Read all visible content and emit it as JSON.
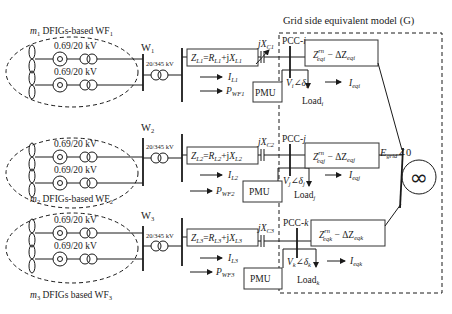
{
  "title": "Grid side equivalent model (G)",
  "grid_source": {
    "label_main": "E",
    "label_sub": "grid",
    "label_angle": "∠0",
    "symbol": "∞"
  },
  "wind_farms": [
    {
      "id": "WF1",
      "label_count": "m",
      "label_count_sub": "1",
      "label_text": " DFIGs-based WF",
      "label_text_sub": "1",
      "turbine_transformer_rating": "0.69/20 kV",
      "bus_label": "W",
      "bus_label_sub": "1",
      "step_up_rating": "20/345 kV",
      "line_impedance": {
        "Z": "Z",
        "Zsub": "L1",
        "eq": "=",
        "R": "R",
        "Rsub": "L1",
        "plus": "+j",
        "X": "X",
        "Xsub": "L1"
      },
      "capacitor": {
        "prefix": "jX",
        "sub": "C1",
        "variable": true
      },
      "current": {
        "main": "I",
        "sub": "L1"
      },
      "power": {
        "main": "P",
        "sub": "WF1"
      },
      "pmu_label": "PMU",
      "pcc_label": "PCC-",
      "pcc_index": "i",
      "voltage": {
        "V": "V",
        "Vsub": "i",
        "angle": "∠δ",
        "dsub": "i"
      },
      "load": {
        "main": "Load",
        "sub": "i"
      },
      "eq_impedance": {
        "Z": "Z",
        "sup": "rn",
        "sub": "eqi",
        "minus": " − ΔZ",
        "dsub": "eqi"
      },
      "eq_current": {
        "main": "I",
        "sub": "eqi"
      }
    },
    {
      "id": "WF2",
      "label_count": "m",
      "label_count_sub": "2",
      "label_text": " DFIGs-based WF",
      "label_text_sub": "2",
      "turbine_transformer_rating": "0.69/20 kV",
      "bus_label": "W",
      "bus_label_sub": "2",
      "step_up_rating": "20/345 kV",
      "line_impedance": {
        "Z": "Z",
        "Zsub": "L2",
        "eq": "=",
        "R": "R",
        "Rsub": "L2",
        "plus": "+j",
        "X": "X",
        "Xsub": "L2"
      },
      "capacitor": {
        "prefix": "jX",
        "sub": "C2",
        "variable": false
      },
      "current": {
        "main": "I",
        "sub": "L2"
      },
      "power": {
        "main": "P",
        "sub": "WF2"
      },
      "pmu_label": "PMU",
      "pcc_label": "PCC-",
      "pcc_index": "j",
      "voltage": {
        "V": "V",
        "Vsub": "j",
        "angle": "∠δ",
        "dsub": "j"
      },
      "load": {
        "main": "Load",
        "sub": "j"
      },
      "eq_impedance": {
        "Z": "Z",
        "sup": "rn",
        "sub": "eqj",
        "minus": " − ΔZ",
        "dsub": "eqj"
      },
      "eq_current": {
        "main": "I",
        "sub": "eqj"
      }
    },
    {
      "id": "WF3",
      "label_count": "m",
      "label_count_sub": "3",
      "label_text": " DFIGs based WF",
      "label_text_sub": "3",
      "turbine_transformer_rating": "0.69/20 kV",
      "bus_label": "W",
      "bus_label_sub": "3",
      "step_up_rating": "20/345 kV",
      "line_impedance": {
        "Z": "Z",
        "Zsub": "L3",
        "eq": "=",
        "R": "R",
        "Rsub": "L3",
        "plus": "+j",
        "X": "X",
        "Xsub": "L3"
      },
      "capacitor": {
        "prefix": "jX",
        "sub": "C3",
        "variable": false
      },
      "current": {
        "main": "I",
        "sub": "L3"
      },
      "power": {
        "main": "P",
        "sub": "WF3"
      },
      "pmu_label": "PMU",
      "pcc_label": "PCC-",
      "pcc_index": "k",
      "voltage": {
        "V": "V",
        "Vsub": "k",
        "angle": "∠δ",
        "dsub": "k"
      },
      "load": {
        "main": "Load",
        "sub": "k"
      },
      "eq_impedance": {
        "Z": "Z",
        "sup": "rn",
        "sub": "eqk",
        "minus": " − ΔZ",
        "dsub": "eqk"
      },
      "eq_current": {
        "main": "I",
        "sub": "eqk"
      }
    }
  ],
  "colors": {
    "line": "#1a1a1a",
    "box_border": "#333333",
    "background": "#ffffff"
  }
}
